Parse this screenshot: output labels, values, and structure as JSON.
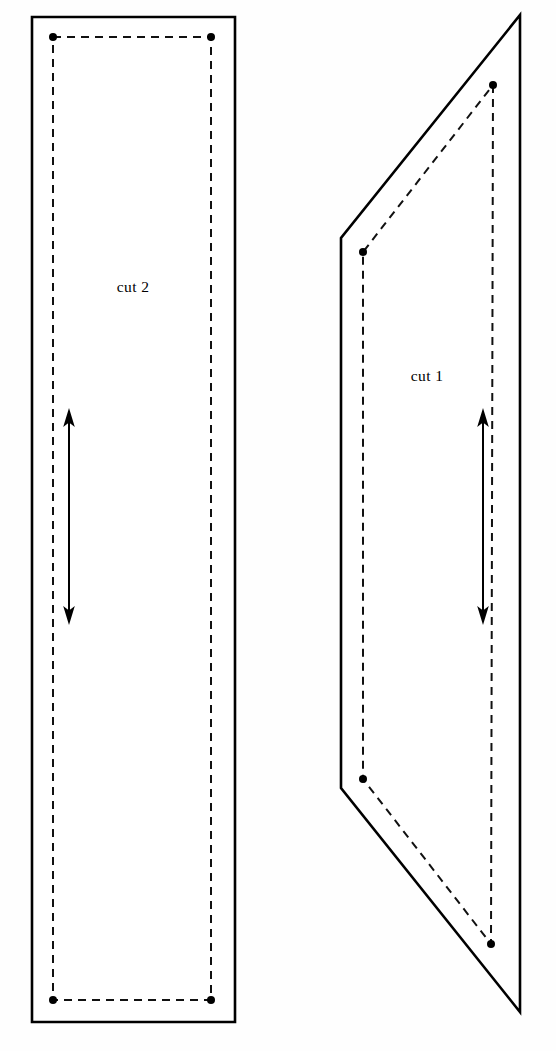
{
  "canvas": {
    "width": 556,
    "height": 1051,
    "background": "#fefefe",
    "title": "Cut pattern layout"
  },
  "colors": {
    "outline": "#000000",
    "dashed": "#111111",
    "fill": "#ffffff",
    "label": "#000000"
  },
  "labels": {
    "cut2": "cut 2",
    "cut1": "cut 1"
  },
  "chart_data": {
    "type": "diagram",
    "shapes": [
      {
        "name": "cut-2-piece",
        "label": "cut 2",
        "label_position": [
          133,
          287
        ],
        "outline_type": "rectangle",
        "outline_points": [
          [
            32,
            17
          ],
          [
            235,
            17
          ],
          [
            235,
            1022
          ],
          [
            32,
            1022
          ]
        ],
        "seam_type": "rectangle",
        "seam_points": [
          [
            53,
            37
          ],
          [
            211,
            37
          ],
          [
            211,
            1000
          ],
          [
            53,
            1000
          ]
        ],
        "seam_vertices": [
          [
            53,
            37
          ],
          [
            211,
            37
          ],
          [
            211,
            1000
          ],
          [
            53,
            1000
          ]
        ],
        "grain_arrow": {
          "x": 69,
          "y_top": 411,
          "y_bottom": 622,
          "direction": "double"
        }
      },
      {
        "name": "cut-1-piece",
        "label": "cut 1",
        "label_position": [
          427,
          376
        ],
        "outline_type": "quadrilateral",
        "outline_points": [
          [
            520,
            15
          ],
          [
            520,
            1012
          ],
          [
            341,
            788
          ],
          [
            341,
            238
          ]
        ],
        "seam_type": "quadrilateral",
        "seam_points": [
          [
            493,
            85
          ],
          [
            491,
            944
          ],
          [
            363,
            779
          ],
          [
            363,
            252
          ]
        ],
        "seam_vertices": [
          [
            493,
            85
          ],
          [
            363,
            252
          ],
          [
            363,
            779
          ],
          [
            491,
            944
          ]
        ],
        "grain_arrow": {
          "x": 483,
          "y_top": 411,
          "y_bottom": 622,
          "direction": "double"
        }
      }
    ],
    "style": {
      "dash_pattern": "8 6",
      "outline_stroke_width": 2.6,
      "dashed_stroke_width": 2.0,
      "vertex_dot_radius": 4.0,
      "arrow_stroke_width": 2.0
    }
  }
}
